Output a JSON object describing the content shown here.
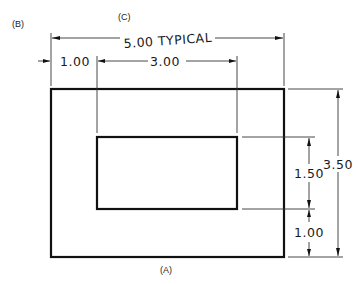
{
  "panel_labels": {
    "a": "(A)",
    "b": "(B)",
    "c": "(C)"
  },
  "dimensions": {
    "overall_width": "5.00 TYPICAL",
    "left_margin": "1.00",
    "inner_width": "3.00",
    "overall_height": "3.50",
    "inner_height": "1.50",
    "bottom_margin": "1.00"
  },
  "shapes": {
    "outer_rect": {
      "x": 51,
      "y": 89,
      "w": 233,
      "h": 168
    },
    "inner_rect": {
      "x": 97,
      "y": 137,
      "w": 140,
      "h": 72
    }
  },
  "colors": {
    "line": "#111111",
    "background": "#ffffff"
  }
}
